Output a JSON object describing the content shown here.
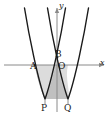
{
  "figure": {
    "background_color": "#ffffff",
    "curve_color": "#1a1a1a",
    "axis_color": "#8a8a8a",
    "shade_color": "#bfbfbf",
    "width": 111,
    "height": 119
  },
  "axes": {
    "x_label": "x",
    "y_label": "y",
    "origin_label": "O",
    "x_axis_y": 65,
    "y_axis_x": 57
  },
  "points": [
    {
      "name": "A",
      "label": "A",
      "x": 34,
      "y": 65
    },
    {
      "name": "B",
      "label": "B",
      "x": 58,
      "y": 57
    },
    {
      "name": "O",
      "label": "O",
      "x": 57,
      "y": 65
    },
    {
      "name": "P",
      "label": "P",
      "x": 45,
      "y": 99
    },
    {
      "name": "Q",
      "label": "Q",
      "x": 68,
      "y": 99
    }
  ],
  "curves": [
    {
      "name": "left-parabola",
      "vertex_label": "P",
      "vertex": {
        "x": 45,
        "y": 99
      },
      "opens": "up"
    },
    {
      "name": "right-parabola",
      "vertex_label": "Q",
      "vertex": {
        "x": 68,
        "y": 99
      },
      "opens": "up"
    }
  ],
  "shaded_region": {
    "description": "Region bounded by x-axis from A, the two parabolas and the segment PQ",
    "fill": "#bfbfbf"
  },
  "segments": [
    {
      "name": "segment-P-vertical",
      "from": {
        "x": 45,
        "y": 99
      },
      "to": {
        "x": 45,
        "y": 103
      }
    },
    {
      "name": "segment-Q-vertical",
      "from": {
        "x": 68,
        "y": 99
      },
      "to": {
        "x": 68,
        "y": 103
      }
    }
  ]
}
